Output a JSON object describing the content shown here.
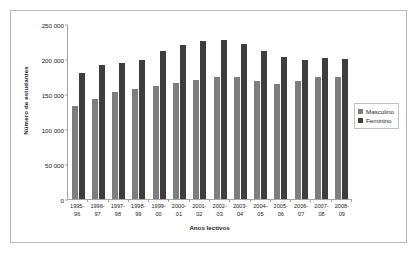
{
  "chart_data": {
    "type": "bar",
    "title": "",
    "xlabel": "Anos lectivos",
    "ylabel": "Número de estudantes",
    "ylim": [
      0,
      250000
    ],
    "ytick_step": 50000,
    "ytick_labels": [
      "250 000",
      "200 000",
      "150 000",
      "100 000",
      "50 000",
      "0"
    ],
    "ytick_values": [
      250000,
      200000,
      150000,
      100000,
      50000,
      0
    ],
    "grid": false,
    "legend_position": "right",
    "categories": [
      "1995-96",
      "1996-97",
      "1997-98",
      "1998-99",
      "1999-00",
      "2000-01",
      "2001-02",
      "2002-03",
      "2003-04",
      "2004-05",
      "2005-06",
      "2006-07",
      "2007-08",
      "2008-09"
    ],
    "category_lines": [
      [
        "1995-",
        "96"
      ],
      [
        "1996-",
        "97"
      ],
      [
        "1997-",
        "98"
      ],
      [
        "1998-",
        "99"
      ],
      [
        "1999-",
        "00"
      ],
      [
        "2000-",
        "01"
      ],
      [
        "2001-",
        "02"
      ],
      [
        "2002-",
        "03"
      ],
      [
        "2003-",
        "04"
      ],
      [
        "2004-",
        "05"
      ],
      [
        "2005-",
        "06"
      ],
      [
        "2006-",
        "07"
      ],
      [
        "2007-",
        "08"
      ],
      [
        "2008-",
        "09"
      ]
    ],
    "series": [
      {
        "name": "Masculino",
        "color": "#7e7e7e",
        "values": [
          133000,
          143000,
          153000,
          157000,
          162000,
          166000,
          170000,
          174000,
          174000,
          168000,
          164000,
          168000,
          175000,
          174000
        ]
      },
      {
        "name": "Feminino",
        "color": "#3e3e3e",
        "values": [
          180000,
          192000,
          195000,
          199000,
          211000,
          220000,
          226000,
          227000,
          221000,
          212000,
          203000,
          198000,
          202000,
          200000
        ]
      }
    ]
  },
  "legend": {
    "items": [
      {
        "label": "Masculino",
        "color": "#7e7e7e"
      },
      {
        "label": "Feminino",
        "color": "#3e3e3e"
      }
    ]
  }
}
